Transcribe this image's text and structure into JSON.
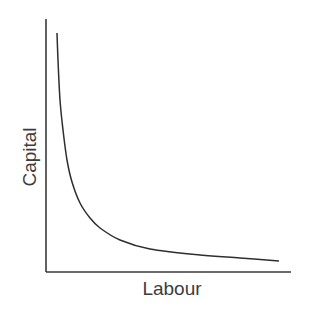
{
  "chart_data": {
    "type": "line",
    "title": "",
    "xlabel": "Labour",
    "ylabel": "Capital",
    "grid": false,
    "legend": null,
    "x_ticks": [],
    "y_ticks": [],
    "series": [
      {
        "name": "isoquant",
        "color": "#2e2e2e",
        "points_px": [
          [
            57,
            33
          ],
          [
            58,
            60
          ],
          [
            60,
            100
          ],
          [
            63,
            130
          ],
          [
            67,
            160
          ],
          [
            72,
            182
          ],
          [
            80,
            203
          ],
          [
            90,
            218
          ],
          [
            100,
            228
          ],
          [
            120,
            240
          ],
          [
            150,
            249
          ],
          [
            200,
            255
          ],
          [
            240,
            258
          ],
          [
            279,
            261
          ]
        ]
      }
    ]
  },
  "axes": {
    "x_label": "Labour",
    "y_label": "Capital",
    "color": "#3a3a3a"
  }
}
